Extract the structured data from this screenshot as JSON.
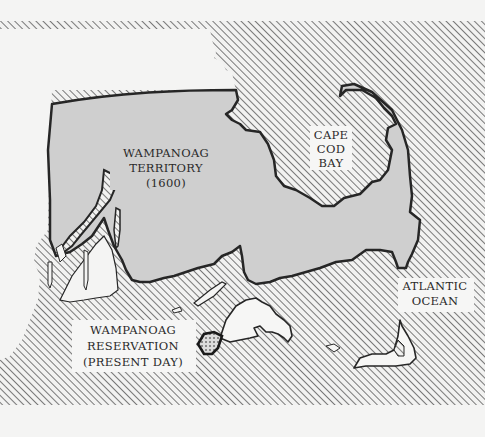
{
  "map": {
    "title": "Wampanoag Territory Map",
    "region": "Southeastern Massachusetts / Cape Cod",
    "labels": {
      "territory": [
        "WAMPANOAG",
        "TERRITORY",
        "(1600)"
      ],
      "cape_cod_bay": [
        "CAPE",
        "COD",
        "BAY"
      ],
      "atlantic_ocean": [
        "ATLANTIC",
        "OCEAN"
      ],
      "reservation": [
        "WAMPANOAG",
        "RESERVATION",
        "(PRESENT DAY)"
      ]
    },
    "legend_semantics": {
      "hatched": "water",
      "grey_fill": "Wampanoag territory (1600)",
      "white_fill": "other land",
      "dotted": "Wampanoag reservation (present day)"
    },
    "colors": {
      "paper": "#f4f4f3",
      "territory": "#cfcfcf",
      "outline": "#262626",
      "hatch": "#5a5a5a",
      "island": "#f6f6f5"
    }
  }
}
